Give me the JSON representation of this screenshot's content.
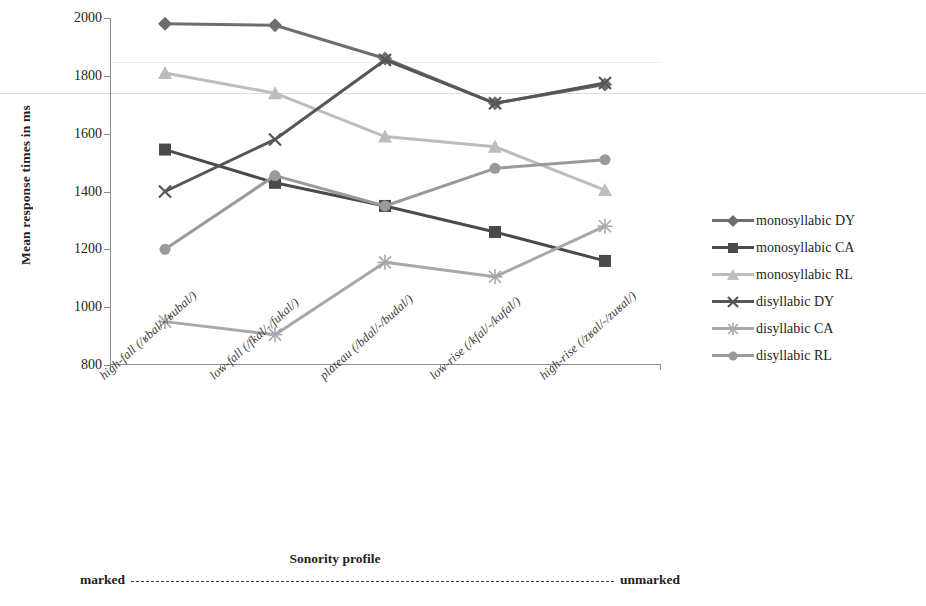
{
  "chart_data": {
    "type": "line",
    "title": "",
    "xlabel": "Sonority profile",
    "ylabel": "Mean response times in ms",
    "ylim": [
      800,
      2000
    ],
    "yticks": [
      800,
      1000,
      1200,
      1400,
      1600,
      1800,
      2000
    ],
    "grid": false,
    "legend_position": "right",
    "categories": [
      "high-fall (/ʁbal/-/ʁubal/)",
      "low-fall (/fkal/-/fukal/)",
      "plateau (/bdal/-/budal/)",
      "low-rise (/kfal/-/kufal/)",
      "high-rise (/zʁal/-/zuʁal/)"
    ],
    "series": [
      {
        "name": "monosyllabic DY",
        "marker": "diamond",
        "color": "#6e6e6e",
        "values": [
          1980,
          1975,
          1860,
          1705,
          1770
        ]
      },
      {
        "name": "monosyllabic CA",
        "marker": "square",
        "color": "#4a4a4a",
        "values": [
          1545,
          1430,
          1350,
          1260,
          1160
        ]
      },
      {
        "name": "monosyllabic RL",
        "marker": "triangle",
        "color": "#bdbdbd",
        "values": [
          1810,
          1740,
          1590,
          1555,
          1405
        ]
      },
      {
        "name": "disyllabic DY",
        "marker": "cross",
        "color": "#565656",
        "values": [
          1400,
          1580,
          1855,
          1705,
          1775
        ]
      },
      {
        "name": "disyllabic CA",
        "marker": "star",
        "color": "#a8a8a8",
        "values": [
          950,
          905,
          1155,
          1105,
          1280
        ]
      },
      {
        "name": "disyllabic RL",
        "marker": "circle",
        "color": "#9a9a9a",
        "values": [
          1200,
          1455,
          1350,
          1480,
          1510
        ]
      }
    ],
    "annotations": {
      "markedness_left": "marked",
      "markedness_right": "unmarked"
    }
  },
  "legend": {
    "items": [
      {
        "label": "monosyllabic DY"
      },
      {
        "label": "monosyllabic CA"
      },
      {
        "label": "monosyllabic RL"
      },
      {
        "label": "disyllabic DY"
      },
      {
        "label": "disyllabic CA"
      },
      {
        "label": "disyllabic RL"
      }
    ]
  },
  "axes": {
    "y_title": "Mean response times in ms",
    "x_title": "Sonority profile",
    "y_tick_labels": [
      "2000",
      "1800",
      "1600",
      "1400",
      "1200",
      "1000",
      "800"
    ],
    "x_tick_labels": [
      "high-fall (/ʁbal/-/ʁubal/)",
      "low-fall (/fkal/-/fukal/)",
      "plateau (/bdal/-/budal/)",
      "low-rise (/kfal/-/kufal/)",
      "high-rise (/zʁal/-/zuʁal/)"
    ]
  },
  "markedness": {
    "left": "marked",
    "right": "unmarked"
  }
}
